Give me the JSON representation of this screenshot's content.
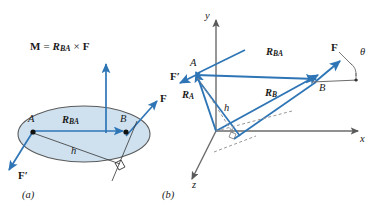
{
  "figure": {
    "colors": {
      "vector_blue": "#2e75b6",
      "ellipse_fill": "#cfe1ef",
      "ellipse_stroke": "#5a5a5a",
      "axis_gray": "#6b6b6b",
      "dashed_gray": "#8a8a8a",
      "text_black": "#1a1a1a"
    }
  },
  "panel_a": {
    "caption": "(a)",
    "moment_equation": {
      "m": "M",
      "equals": "=",
      "r": "R",
      "r_sub": "BA",
      "cross": "×",
      "f": "F"
    },
    "labels": {
      "point_a": "A",
      "point_b": "B",
      "r_ba": "R",
      "r_ba_sub": "BA",
      "force_f": "F",
      "force_f_prime": "F′",
      "moment_arm": "h"
    }
  },
  "panel_b": {
    "caption": "(b)",
    "axes": {
      "x": "x",
      "y": "y",
      "z": "z"
    },
    "labels": {
      "point_a": "A",
      "point_b": "B",
      "r_a": "R",
      "r_a_sub": "A",
      "r_b": "R",
      "r_b_sub": "B",
      "r_ba": "R",
      "r_ba_sub": "BA",
      "force_f": "F",
      "force_f_prime": "F′",
      "moment_arm": "h",
      "angle_theta": "θ"
    }
  }
}
